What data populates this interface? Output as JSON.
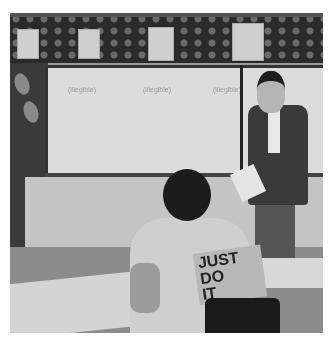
{
  "image": {
    "description": "Black-and-white photograph of a classroom: a teacher holding a pointer and paper stands beside a whiteboard while a student in a 'JUST DO IT' t-shirt sits at a desk in the foreground facing her.",
    "scene": {
      "top_border": "Decorative bulletin-board border with small repeating motifs and four pinned children's drawings",
      "whiteboard": {
        "visible_text": [
          "(illegible)",
          "(illegible)",
          "(illegible)"
        ]
      },
      "teacher": "Woman with short dark hair, dark cardigan over white top, holding a pointer and a sheet of paper",
      "student": "Student with short dark hair seen from behind",
      "shirt_text": [
        "JUST",
        "DO",
        "IT"
      ]
    },
    "palette": {
      "background": "#ffffff",
      "border_dark": "#2a2a2a",
      "whiteboard": "#dcdcdc",
      "floor": "#8c8c8c"
    }
  }
}
